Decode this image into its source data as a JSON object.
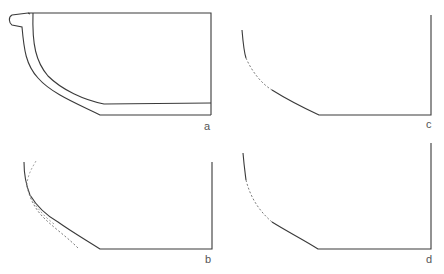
{
  "figure": {
    "panels": [
      {
        "id": "a",
        "label": "a",
        "description": "Full vessel profile section with rolled rim and wall thickness"
      },
      {
        "id": "b",
        "label": "b",
        "description": "Profile outline with two alternative dashed reconstructions of the lower wall"
      },
      {
        "id": "c",
        "label": "c",
        "description": "Profile outline with dashed reconstructed wall segment"
      },
      {
        "id": "d",
        "label": "d",
        "description": "Profile outline with dashed reconstructed wall segment"
      }
    ],
    "colors": {
      "line": "#3a3a3a",
      "dashed": "#6a6a6a",
      "label": "#555555",
      "background": "#ffffff"
    }
  }
}
